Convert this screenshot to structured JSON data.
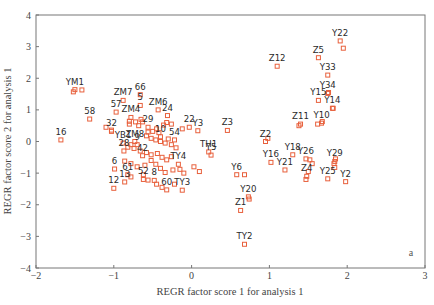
{
  "chart_data": {
    "type": "scatter",
    "title": "",
    "panel_label": "a",
    "xlabel": "REGR factor score 1 for analysis 1",
    "ylabel": "REGR factor score 2 for analysis 1",
    "xlim": [
      -2,
      3
    ],
    "ylim": [
      -4,
      4
    ],
    "xticks": [
      -2,
      -1,
      0,
      1,
      2,
      3
    ],
    "yticks": [
      -4,
      -3,
      -2,
      -1,
      0,
      1,
      2,
      3,
      4
    ],
    "xtick_labels": [
      "−2",
      "−1",
      "0",
      "1",
      "2",
      "3"
    ],
    "ytick_labels": [
      "−4",
      "−3",
      "−2",
      "−1",
      "0",
      "1",
      "2",
      "3",
      "4"
    ],
    "grid": false,
    "legend": null,
    "marker": "open-square",
    "marker_color": "#e8603c",
    "labeled_points": [
      {
        "label": "YM1",
        "x": -1.5,
        "y": 1.64
      },
      {
        "label": "16",
        "x": -1.68,
        "y": 0.05
      },
      {
        "label": "58",
        "x": -1.31,
        "y": 0.71
      },
      {
        "label": "57",
        "x": -0.97,
        "y": 0.93
      },
      {
        "label": "ZM7",
        "x": -0.88,
        "y": 1.3
      },
      {
        "label": "66",
        "x": -0.66,
        "y": 1.48
      },
      {
        "label": "5",
        "x": -0.66,
        "y": 1.14
      },
      {
        "label": "ZM6",
        "x": -0.43,
        "y": 1.0
      },
      {
        "label": "24",
        "x": -0.31,
        "y": 0.82
      },
      {
        "label": "ZM4",
        "x": -0.78,
        "y": 0.76
      },
      {
        "label": "32",
        "x": -1.03,
        "y": 0.32
      },
      {
        "label": "29",
        "x": -0.56,
        "y": 0.45
      },
      {
        "label": "22",
        "x": -0.03,
        "y": 0.45
      },
      {
        "label": "Y3",
        "x": 0.08,
        "y": 0.34
      },
      {
        "label": "54",
        "x": -0.22,
        "y": 0.05
      },
      {
        "label": "10",
        "x": -0.4,
        "y": 0.15
      },
      {
        "label": "YB1",
        "x": -0.88,
        "y": -0.05
      },
      {
        "label": "ZM8",
        "x": -0.73,
        "y": 0.0
      },
      {
        "label": "9",
        "x": -0.7,
        "y": -0.1
      },
      {
        "label": "TH1",
        "x": 0.22,
        "y": -0.33
      },
      {
        "label": "Z3",
        "x": 0.46,
        "y": 0.35
      },
      {
        "label": "Y5",
        "x": 0.25,
        "y": -0.43
      },
      {
        "label": "6",
        "x": -0.99,
        "y": -0.87
      },
      {
        "label": "28",
        "x": -0.87,
        "y": -0.3
      },
      {
        "label": "42",
        "x": -0.63,
        "y": -0.45
      },
      {
        "label": "TY4",
        "x": -0.17,
        "y": -0.72
      },
      {
        "label": "61",
        "x": -0.82,
        "y": -1.05
      },
      {
        "label": "13",
        "x": -0.86,
        "y": -1.28
      },
      {
        "label": "12",
        "x": -1.0,
        "y": -1.48
      },
      {
        "label": "52",
        "x": -0.62,
        "y": -1.2
      },
      {
        "label": "8",
        "x": -0.48,
        "y": -1.23
      },
      {
        "label": "60",
        "x": -0.32,
        "y": -1.53
      },
      {
        "label": "TY3",
        "x": -0.12,
        "y": -1.54
      },
      {
        "label": "Y6",
        "x": 0.58,
        "y": -1.05
      },
      {
        "label": "Z2",
        "x": 0.95,
        "y": 0.0
      },
      {
        "label": "Y16",
        "x": 1.02,
        "y": -0.66
      },
      {
        "label": "Y21",
        "x": 1.2,
        "y": -0.9
      },
      {
        "label": "Y20",
        "x": 0.73,
        "y": -1.75
      },
      {
        "label": "Z1",
        "x": 0.63,
        "y": -2.18
      },
      {
        "label": "TY2",
        "x": 0.68,
        "y": -3.25
      },
      {
        "label": "Z12",
        "x": 1.1,
        "y": 2.38
      },
      {
        "label": "Z11",
        "x": 1.4,
        "y": 0.55
      },
      {
        "label": "Y18",
        "x": 1.3,
        "y": -0.42
      },
      {
        "label": "Y26",
        "x": 1.47,
        "y": -0.55
      },
      {
        "label": "Z4",
        "x": 1.48,
        "y": -1.1
      },
      {
        "label": "Y10",
        "x": 1.67,
        "y": 0.58
      },
      {
        "label": "Y29",
        "x": 1.84,
        "y": -0.63
      },
      {
        "label": "Y25",
        "x": 1.75,
        "y": -1.18
      },
      {
        "label": "Y2",
        "x": 1.98,
        "y": -1.27
      },
      {
        "label": "Y15",
        "x": 1.63,
        "y": 1.3
      },
      {
        "label": "Y14",
        "x": 1.81,
        "y": 1.05
      },
      {
        "label": "Y34",
        "x": 1.75,
        "y": 1.52
      },
      {
        "label": "Y33",
        "x": 1.75,
        "y": 2.1
      },
      {
        "label": "Z5",
        "x": 1.63,
        "y": 2.65
      },
      {
        "label": "Y22",
        "x": 1.91,
        "y": 3.18
      }
    ],
    "unlabeled_points": [
      [
        -1.52,
        1.57
      ],
      [
        -1.41,
        1.63
      ],
      [
        -1.1,
        0.45
      ],
      [
        -1.03,
        0.36
      ],
      [
        -0.8,
        0.64
      ],
      [
        -0.8,
        0.55
      ],
      [
        -0.72,
        0.62
      ],
      [
        -0.65,
        0.7
      ],
      [
        -0.63,
        0.62
      ],
      [
        -0.68,
        0.5
      ],
      [
        -0.56,
        0.3
      ],
      [
        -0.5,
        0.32
      ],
      [
        -0.45,
        0.4
      ],
      [
        -0.42,
        0.28
      ],
      [
        -0.36,
        0.52
      ],
      [
        -0.32,
        0.6
      ],
      [
        -0.26,
        0.55
      ],
      [
        -0.12,
        0.4
      ],
      [
        -0.58,
        0.18
      ],
      [
        -0.52,
        0.1
      ],
      [
        -0.46,
        0.05
      ],
      [
        -0.4,
        0.0
      ],
      [
        -0.34,
        -0.05
      ],
      [
        -0.3,
        0.08
      ],
      [
        -0.26,
        -0.1
      ],
      [
        -0.2,
        -0.2
      ],
      [
        -0.82,
        -0.18
      ],
      [
        -0.78,
        -0.1
      ],
      [
        -0.74,
        -0.22
      ],
      [
        -0.66,
        -0.3
      ],
      [
        -0.58,
        -0.35
      ],
      [
        -0.52,
        -0.42
      ],
      [
        -0.44,
        -0.38
      ],
      [
        -0.38,
        -0.5
      ],
      [
        -0.32,
        -0.58
      ],
      [
        -0.26,
        -0.48
      ],
      [
        -0.86,
        -0.62
      ],
      [
        -0.78,
        -0.7
      ],
      [
        -0.7,
        -0.8
      ],
      [
        -0.6,
        -0.75
      ],
      [
        -0.52,
        -0.6
      ],
      [
        -0.46,
        -0.72
      ],
      [
        -0.4,
        -0.85
      ],
      [
        -0.34,
        -0.98
      ],
      [
        -0.24,
        -0.9
      ],
      [
        -0.15,
        -0.88
      ],
      [
        -0.1,
        -1.0
      ],
      [
        0.03,
        -0.8
      ],
      [
        0.1,
        -0.95
      ],
      [
        -0.78,
        -1.12
      ],
      [
        -0.62,
        -1.05
      ],
      [
        -0.56,
        -1.22
      ],
      [
        -0.45,
        -1.35
      ],
      [
        -0.38,
        -1.45
      ],
      [
        -0.22,
        -1.35
      ],
      [
        0.68,
        -1.05
      ],
      [
        0.98,
        0.1
      ],
      [
        1.38,
        0.5
      ],
      [
        1.62,
        0.55
      ],
      [
        1.68,
        0.63
      ],
      [
        1.52,
        -0.58
      ],
      [
        1.55,
        -0.7
      ],
      [
        1.83,
        -0.7
      ],
      [
        1.84,
        -0.82
      ],
      [
        1.85,
        -0.55
      ],
      [
        1.5,
        -0.95
      ],
      [
        1.47,
        -1.2
      ],
      [
        0.74,
        -1.82
      ],
      [
        1.82,
        1.05
      ],
      [
        1.76,
        1.55
      ],
      [
        1.95,
        2.95
      ]
    ]
  }
}
